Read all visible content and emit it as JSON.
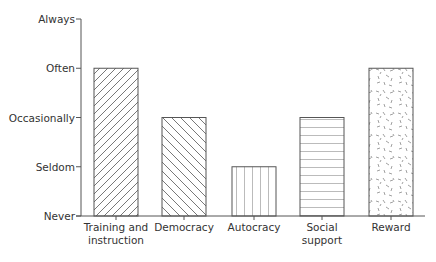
{
  "chart_data": {
    "type": "bar",
    "title": "",
    "xlabel": "",
    "ylabel": "",
    "y_levels": [
      "Never",
      "Seldom",
      "Occasionally",
      "Often",
      "Always"
    ],
    "categories": [
      "Training and instruction",
      "Democracy",
      "Autocracy",
      "Social support",
      "Reward"
    ],
    "category_labels": [
      "Training and\ninstruction",
      "Democracy",
      "Autocracy",
      "Social\nsupport",
      "Reward"
    ],
    "values": [
      3,
      2,
      1,
      2,
      3
    ],
    "value_labels": [
      "Often",
      "Occasionally",
      "Seldom",
      "Occasionally",
      "Often"
    ],
    "patterns": [
      "diagonal-forward",
      "diagonal-back",
      "vertical",
      "horizontal",
      "speckle"
    ],
    "ylim": [
      0,
      4
    ],
    "grid": false,
    "legend": "none"
  },
  "colors": {
    "stroke": "#555555",
    "fill": "#ffffff"
  }
}
